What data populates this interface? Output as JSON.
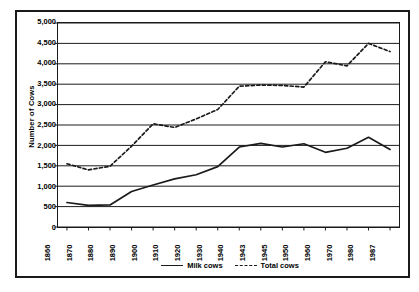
{
  "chart_data": {
    "type": "line",
    "title": "",
    "xlabel": "",
    "ylabel": "Number of Cows",
    "ylim": [
      0,
      5000
    ],
    "ytick_values": [
      0,
      500,
      1000,
      1500,
      2000,
      2500,
      3000,
      3500,
      4000,
      4500,
      5000
    ],
    "ytick_labels": [
      "0",
      "500",
      "1,000",
      "1,500",
      "2,000",
      "2,500",
      "3,000",
      "3,500",
      "4,000",
      "4,500",
      "5,000"
    ],
    "grid": true,
    "grid_orientation": "horizontal",
    "legend_position": "bottom",
    "categories": [
      "1866",
      "1870",
      "1880",
      "1890",
      "1900",
      "1910",
      "1920",
      "1930",
      "1940",
      "1943",
      "1945",
      "1950",
      "1960",
      "1970",
      "1980",
      "1987"
    ],
    "series": [
      {
        "name": "Milk cows",
        "style": "solid",
        "color": "#1a1a1a",
        "values": [
          600,
          530,
          540,
          870,
          1030,
          1180,
          1280,
          1480,
          1960,
          2050,
          1960,
          2040,
          1830,
          1930,
          2200,
          1900
        ]
      },
      {
        "name": "Total cows",
        "style": "dashed",
        "color": "#1a1a1a",
        "values": [
          1550,
          1400,
          1490,
          1980,
          2530,
          2440,
          2650,
          2880,
          3450,
          3480,
          3470,
          3430,
          4050,
          3950,
          4500,
          4300
        ]
      }
    ]
  },
  "legend": {
    "items": [
      {
        "label": "Milk cows",
        "style": "solid",
        "swatch_name": "legend-swatch-solid"
      },
      {
        "label": "Total cows",
        "style": "dashed",
        "swatch_name": "legend-swatch-dashed"
      }
    ]
  }
}
